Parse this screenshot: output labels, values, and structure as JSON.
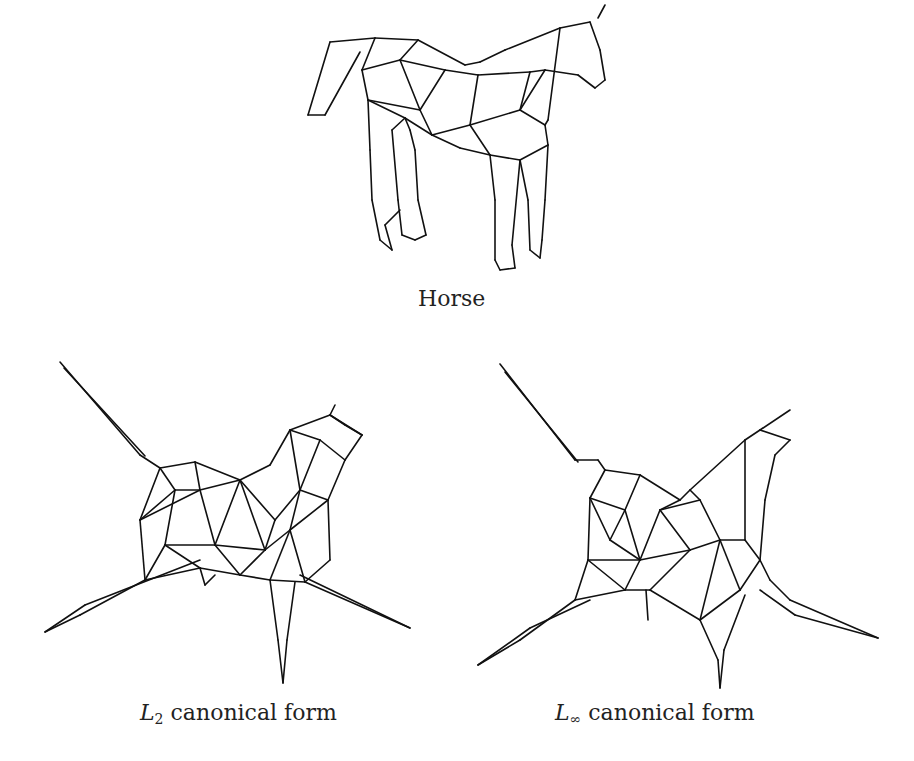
{
  "figures": [
    {
      "id": "horse",
      "caption": {
        "text": "Horse"
      },
      "lines": [
        [
          330,
          42,
          375,
          38
        ],
        [
          375,
          38,
          418,
          40
        ],
        [
          330,
          42,
          308,
          115
        ],
        [
          308,
          115,
          325,
          115
        ],
        [
          325,
          115,
          360,
          52
        ],
        [
          375,
          38,
          362,
          70
        ],
        [
          418,
          40,
          400,
          60
        ],
        [
          418,
          40,
          465,
          65
        ],
        [
          465,
          65,
          480,
          62
        ],
        [
          480,
          62,
          505,
          50
        ],
        [
          505,
          50,
          560,
          28
        ],
        [
          560,
          28,
          590,
          22
        ],
        [
          590,
          22,
          600,
          50
        ],
        [
          600,
          50,
          605,
          80
        ],
        [
          605,
          80,
          595,
          88
        ],
        [
          595,
          88,
          578,
          75
        ],
        [
          578,
          75,
          545,
          70
        ],
        [
          598,
          18,
          605,
          5
        ],
        [
          362,
          70,
          368,
          100
        ],
        [
          368,
          100,
          370,
          150
        ],
        [
          370,
          150,
          372,
          200
        ],
        [
          372,
          200,
          380,
          240
        ],
        [
          380,
          240,
          392,
          250
        ],
        [
          392,
          250,
          385,
          225
        ],
        [
          385,
          225,
          400,
          210
        ],
        [
          362,
          70,
          400,
          60
        ],
        [
          400,
          60,
          445,
          70
        ],
        [
          445,
          70,
          420,
          110
        ],
        [
          400,
          60,
          420,
          110
        ],
        [
          368,
          100,
          420,
          110
        ],
        [
          420,
          110,
          432,
          135
        ],
        [
          368,
          100,
          405,
          118
        ],
        [
          405,
          118,
          432,
          135
        ],
        [
          432,
          135,
          470,
          125
        ],
        [
          470,
          125,
          478,
          75
        ],
        [
          445,
          70,
          478,
          75
        ],
        [
          478,
          75,
          530,
          72
        ],
        [
          530,
          72,
          520,
          110
        ],
        [
          470,
          125,
          520,
          110
        ],
        [
          520,
          110,
          545,
          70
        ],
        [
          545,
          70,
          530,
          72
        ],
        [
          520,
          110,
          545,
          125
        ],
        [
          545,
          125,
          548,
          145
        ],
        [
          548,
          145,
          520,
          160
        ],
        [
          520,
          160,
          490,
          155
        ],
        [
          490,
          155,
          470,
          125
        ],
        [
          490,
          155,
          460,
          148
        ],
        [
          460,
          148,
          432,
          135
        ],
        [
          560,
          28,
          548,
          120
        ],
        [
          548,
          120,
          545,
          125
        ],
        [
          405,
          118,
          392,
          130
        ],
        [
          392,
          130,
          398,
          200
        ],
        [
          398,
          200,
          402,
          235
        ],
        [
          402,
          235,
          415,
          240
        ],
        [
          415,
          240,
          426,
          235
        ],
        [
          426,
          235,
          418,
          200
        ],
        [
          418,
          200,
          415,
          150
        ],
        [
          415,
          150,
          410,
          130
        ],
        [
          410,
          130,
          405,
          118
        ],
        [
          490,
          155,
          495,
          200
        ],
        [
          495,
          200,
          495,
          260
        ],
        [
          495,
          260,
          500,
          270
        ],
        [
          500,
          270,
          515,
          268
        ],
        [
          515,
          268,
          512,
          245
        ],
        [
          512,
          245,
          520,
          160
        ],
        [
          520,
          160,
          528,
          200
        ],
        [
          528,
          200,
          530,
          250
        ],
        [
          530,
          250,
          540,
          258
        ],
        [
          540,
          258,
          542,
          240
        ],
        [
          542,
          240,
          545,
          200
        ],
        [
          545,
          200,
          548,
          145
        ]
      ]
    },
    {
      "id": "l2",
      "caption": {
        "text": "L",
        "sub": "2",
        "rest": " canonical form"
      },
      "lines": [
        [
          60,
          362,
          140,
          455
        ],
        [
          64,
          368,
          145,
          456
        ],
        [
          140,
          455,
          160,
          468
        ],
        [
          160,
          468,
          140,
          520
        ],
        [
          140,
          520,
          145,
          580
        ],
        [
          145,
          580,
          80,
          615
        ],
        [
          80,
          615,
          45,
          632
        ],
        [
          45,
          632,
          85,
          605
        ],
        [
          85,
          605,
          200,
          560
        ],
        [
          145,
          580,
          200,
          568
        ],
        [
          200,
          568,
          205,
          585
        ],
        [
          205,
          585,
          215,
          575
        ],
        [
          160,
          468,
          195,
          462
        ],
        [
          195,
          462,
          240,
          480
        ],
        [
          240,
          480,
          270,
          465
        ],
        [
          270,
          465,
          290,
          430
        ],
        [
          290,
          430,
          330,
          415
        ],
        [
          330,
          415,
          335,
          405
        ],
        [
          330,
          415,
          362,
          435
        ],
        [
          362,
          435,
          345,
          460
        ],
        [
          345,
          460,
          328,
          500
        ],
        [
          328,
          500,
          330,
          560
        ],
        [
          330,
          560,
          305,
          582
        ],
        [
          305,
          582,
          410,
          628
        ],
        [
          410,
          628,
          300,
          575
        ],
        [
          140,
          520,
          200,
          490
        ],
        [
          195,
          462,
          200,
          490
        ],
        [
          200,
          490,
          240,
          480
        ],
        [
          200,
          490,
          215,
          545
        ],
        [
          215,
          545,
          240,
          480
        ],
        [
          215,
          545,
          265,
          550
        ],
        [
          265,
          550,
          240,
          480
        ],
        [
          265,
          550,
          275,
          520
        ],
        [
          275,
          520,
          240,
          480
        ],
        [
          275,
          520,
          300,
          490
        ],
        [
          300,
          490,
          290,
          430
        ],
        [
          300,
          490,
          328,
          500
        ],
        [
          300,
          490,
          290,
          530
        ],
        [
          290,
          530,
          328,
          500
        ],
        [
          290,
          530,
          265,
          550
        ],
        [
          265,
          550,
          240,
          575
        ],
        [
          240,
          575,
          215,
          545
        ],
        [
          240,
          575,
          270,
          580
        ],
        [
          270,
          580,
          290,
          530
        ],
        [
          270,
          580,
          305,
          582
        ],
        [
          305,
          582,
          290,
          530
        ],
        [
          270,
          580,
          278,
          640
        ],
        [
          278,
          640,
          283,
          683
        ],
        [
          283,
          683,
          287,
          640
        ],
        [
          287,
          640,
          295,
          582
        ],
        [
          160,
          468,
          175,
          490
        ],
        [
          175,
          490,
          200,
          490
        ],
        [
          175,
          490,
          140,
          520
        ],
        [
          175,
          490,
          165,
          545
        ],
        [
          165,
          545,
          145,
          580
        ],
        [
          165,
          545,
          215,
          545
        ],
        [
          165,
          545,
          200,
          568
        ],
        [
          200,
          568,
          240,
          575
        ],
        [
          290,
          430,
          320,
          440
        ],
        [
          320,
          440,
          345,
          460
        ],
        [
          320,
          440,
          300,
          490
        ],
        [
          330,
          415,
          345,
          425
        ],
        [
          345,
          425,
          362,
          435
        ]
      ]
    },
    {
      "id": "linf",
      "caption": {
        "text": "L",
        "sub": "∞",
        "rest": " canonical form"
      },
      "lines": [
        [
          500,
          364,
          575,
          460
        ],
        [
          505,
          372,
          578,
          462
        ],
        [
          575,
          460,
          598,
          460
        ],
        [
          598,
          460,
          605,
          470
        ],
        [
          605,
          470,
          590,
          498
        ],
        [
          590,
          498,
          588,
          560
        ],
        [
          588,
          560,
          575,
          600
        ],
        [
          575,
          600,
          520,
          640
        ],
        [
          520,
          640,
          478,
          665
        ],
        [
          478,
          665,
          530,
          628
        ],
        [
          530,
          628,
          590,
          600
        ],
        [
          605,
          470,
          640,
          475
        ],
        [
          640,
          475,
          680,
          500
        ],
        [
          680,
          500,
          690,
          490
        ],
        [
          690,
          490,
          745,
          440
        ],
        [
          745,
          440,
          760,
          430
        ],
        [
          760,
          430,
          790,
          410
        ],
        [
          760,
          430,
          790,
          440
        ],
        [
          790,
          440,
          775,
          455
        ],
        [
          775,
          455,
          765,
          500
        ],
        [
          765,
          500,
          760,
          560
        ],
        [
          760,
          560,
          770,
          580
        ],
        [
          770,
          580,
          790,
          600
        ],
        [
          790,
          600,
          878,
          638
        ],
        [
          878,
          638,
          795,
          615
        ],
        [
          795,
          615,
          760,
          590
        ],
        [
          590,
          498,
          625,
          510
        ],
        [
          625,
          510,
          640,
          475
        ],
        [
          625,
          510,
          610,
          540
        ],
        [
          610,
          540,
          590,
          498
        ],
        [
          610,
          540,
          640,
          560
        ],
        [
          640,
          560,
          625,
          510
        ],
        [
          640,
          560,
          660,
          510
        ],
        [
          660,
          510,
          680,
          500
        ],
        [
          660,
          510,
          690,
          550
        ],
        [
          690,
          550,
          640,
          560
        ],
        [
          690,
          550,
          720,
          540
        ],
        [
          720,
          540,
          700,
          500
        ],
        [
          700,
          500,
          690,
          490
        ],
        [
          700,
          500,
          660,
          510
        ],
        [
          720,
          540,
          745,
          540
        ],
        [
          745,
          540,
          745,
          440
        ],
        [
          745,
          540,
          760,
          560
        ],
        [
          588,
          560,
          640,
          560
        ],
        [
          640,
          560,
          625,
          590
        ],
        [
          625,
          590,
          588,
          560
        ],
        [
          625,
          590,
          650,
          590
        ],
        [
          650,
          590,
          690,
          550
        ],
        [
          650,
          590,
          700,
          620
        ],
        [
          700,
          620,
          720,
          540
        ],
        [
          720,
          540,
          740,
          590
        ],
        [
          740,
          590,
          700,
          620
        ],
        [
          740,
          590,
          760,
          560
        ],
        [
          700,
          620,
          718,
          660
        ],
        [
          718,
          660,
          720,
          688
        ],
        [
          720,
          688,
          724,
          650
        ],
        [
          724,
          650,
          745,
          595
        ],
        [
          575,
          600,
          625,
          590
        ],
        [
          646,
          590,
          648,
          620
        ]
      ]
    }
  ]
}
